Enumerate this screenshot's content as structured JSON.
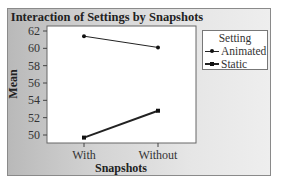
{
  "chart_data": {
    "type": "line",
    "title": "Interaction of Settings by Snapshots",
    "xlabel": "Snapshots",
    "ylabel": "Mean",
    "categories": [
      "With",
      "Without"
    ],
    "ylim": [
      49,
      62
    ],
    "yticks": [
      50,
      52,
      54,
      56,
      58,
      60,
      62
    ],
    "grid": false,
    "legend": {
      "title": "Setting",
      "position": "right",
      "entries": [
        "Animated",
        "Static"
      ]
    },
    "series": [
      {
        "name": "Animated",
        "values": [
          61.4,
          60.1
        ],
        "marker": "circle",
        "line_width": 1
      },
      {
        "name": "Static",
        "values": [
          49.7,
          52.8
        ],
        "marker": "square",
        "line_width": 2
      }
    ]
  },
  "labels": {
    "title": "Interaction of Settings by Snapshots",
    "xlabel": "Snapshots",
    "ylabel": "Mean",
    "legend_title": "Setting",
    "legend_animated": "Animated",
    "legend_static": "Static"
  },
  "colors": {
    "line": "#222222",
    "plot_bg": "#ffffff",
    "panel_bg_left": "#b9b9b9",
    "panel_bg_right": "#eeeeee"
  }
}
